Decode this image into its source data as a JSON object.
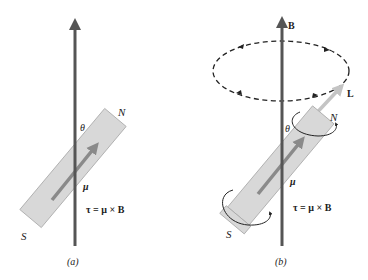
{
  "figure": {
    "panel_a": {
      "caption": "(a)",
      "field_label": "",
      "north_label": "N",
      "south_label": "S",
      "angle_label": "θ",
      "moment_label": "μ",
      "torque_equation": "τ = μ × B"
    },
    "panel_b": {
      "caption": "(b)",
      "field_label": "B",
      "angular_momentum_label": "L",
      "north_label": "N",
      "south_label": "S",
      "angle_label": "θ",
      "moment_label": "μ",
      "torque_equation": "τ = μ × B"
    },
    "colors": {
      "field_arrow": "#555555",
      "magnet_fill": "#d8d8d8",
      "magnet_stroke": "#a8a8a8",
      "moment_arrow": "#8a8a8a",
      "L_arrow": "#c4c4c4",
      "precession_path": "#222222"
    }
  }
}
